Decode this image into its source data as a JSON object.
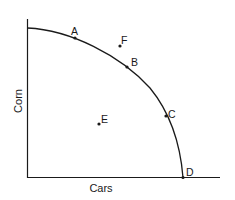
{
  "diagram": {
    "type": "production-possibilities-frontier",
    "x_axis_label": "Cars",
    "y_axis_label": "Corn",
    "curve": "concave frontier from y-axis to x-axis",
    "points": [
      {
        "label": "A",
        "x": 75,
        "y": 38,
        "position": "on-curve"
      },
      {
        "label": "F",
        "x": 120,
        "y": 46,
        "position": "outside-curve"
      },
      {
        "label": "B",
        "x": 127,
        "y": 67,
        "position": "on-curve"
      },
      {
        "label": "C",
        "x": 166,
        "y": 116,
        "position": "on-curve"
      },
      {
        "label": "E",
        "x": 99,
        "y": 124,
        "position": "inside-curve"
      },
      {
        "label": "D",
        "x": 183,
        "y": 177,
        "position": "on-curve-x-intercept"
      }
    ]
  }
}
